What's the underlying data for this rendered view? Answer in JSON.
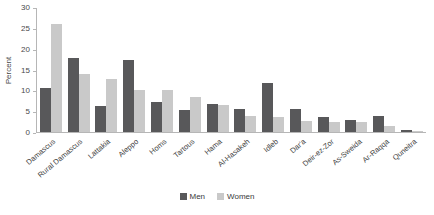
{
  "chart_data": {
    "type": "bar",
    "title": "",
    "subtitle": "",
    "xlabel": "",
    "ylabel": "Percent",
    "ylim": [
      0,
      30
    ],
    "yticks": [
      0,
      5,
      10,
      15,
      20,
      25,
      30
    ],
    "grid": false,
    "legend_position": "bottom",
    "categories": [
      "Damascus",
      "Rural Damascus",
      "Lattakia",
      "Aleppo",
      "Homs",
      "Tartous",
      "Hama",
      "Al-Hasakeh",
      "Idleb",
      "Dar'a",
      "Deir-ez-Zor",
      "As-Sweida",
      "Ar-Raqqa",
      "Quneitra"
    ],
    "series": [
      {
        "name": "Men",
        "color": "#58585a",
        "values": [
          10.5,
          17.7,
          6.3,
          17.2,
          7.2,
          5.3,
          6.7,
          5.6,
          11.7,
          5.6,
          3.6,
          2.8,
          3.9,
          0.4
        ]
      },
      {
        "name": "Women",
        "color": "#c9c9c9",
        "values": [
          26.0,
          13.9,
          12.8,
          10.0,
          10.0,
          8.5,
          6.4,
          3.8,
          3.5,
          2.7,
          2.5,
          2.4,
          1.5,
          0.2
        ]
      }
    ]
  },
  "legend": {
    "items": [
      {
        "label": "Men",
        "color": "#58585a"
      },
      {
        "label": "Women",
        "color": "#c9c9c9"
      }
    ]
  }
}
